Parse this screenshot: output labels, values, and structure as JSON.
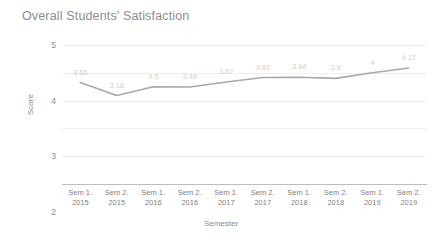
{
  "chart_data": {
    "type": "line",
    "title": "Overall Students' Satisfaction",
    "xlabel": "Semester",
    "ylabel": "Score",
    "ylim": [
      0,
      5
    ],
    "yticks": [
      0,
      1,
      2,
      3,
      4,
      5
    ],
    "ytick_labels": [
      "0",
      "1",
      "2",
      "3",
      "4",
      "5"
    ],
    "grid": true,
    "legend": "none",
    "line_color": "#a8a8a8",
    "label_color": "#cfcfcf",
    "categories": [
      "Sem 1.\n2015",
      "Sem 2.\n2015",
      "Sem 1.\n2016",
      "Sem 2.\n2016",
      "Sem 1.\n2017",
      "Sem 2.\n2017",
      "Sem 1.\n2018",
      "Sem 2.\n2018",
      "Sem 1.\n2019",
      "Sem 2.\n2019"
    ],
    "categories_line1": [
      "Sem 1.",
      "Sem 2.",
      "Sem 1.",
      "Sem 2.",
      "Sem 1.",
      "Sem 2.",
      "Sem 1.",
      "Sem 2.",
      "Sem 1.",
      "Sem 2."
    ],
    "categories_line2": [
      "2015",
      "2015",
      "2016",
      "2016",
      "2017",
      "2017",
      "2018",
      "2018",
      "2019",
      "2019"
    ],
    "values": [
      3.65,
      3.18,
      3.5,
      3.49,
      3.67,
      3.83,
      3.84,
      3.8,
      4,
      4.17
    ],
    "data_labels": [
      "3.65",
      "3.18",
      "3.5",
      "3.49",
      "3.67",
      "3.83",
      "3.84",
      "3.8",
      "4",
      "4.17"
    ]
  }
}
